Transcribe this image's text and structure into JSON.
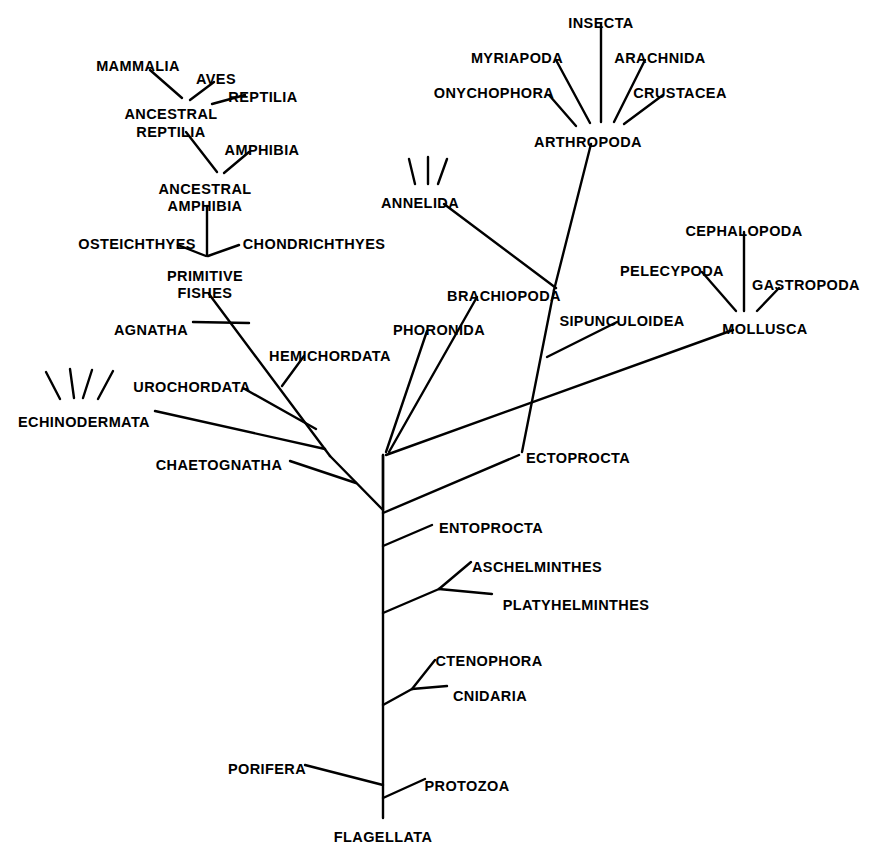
{
  "diagram": {
    "type": "phylogenetic-tree",
    "title": "",
    "background_color": "#ffffff",
    "line_color": "#000000",
    "text_color": "#000000",
    "root_taxon": "FLAGELLATA"
  },
  "labels": [
    {
      "id": "mammalia",
      "text": "MAMMALIA",
      "x": 138,
      "y": 58,
      "align": "center"
    },
    {
      "id": "aves",
      "text": "AVES",
      "x": 216,
      "y": 71,
      "align": "center"
    },
    {
      "id": "reptilia",
      "text": "REPTILIA",
      "x": 263,
      "y": 89,
      "align": "center"
    },
    {
      "id": "ancestral-reptilia-1",
      "text": "ANCESTRAL",
      "x": 171,
      "y": 106,
      "align": "center"
    },
    {
      "id": "ancestral-reptilia-2",
      "text": "REPTILIA",
      "x": 171,
      "y": 124,
      "align": "center"
    },
    {
      "id": "amphibia",
      "text": "AMPHIBIA",
      "x": 262,
      "y": 142,
      "align": "center"
    },
    {
      "id": "ancestral-amphibia-1",
      "text": "ANCESTRAL",
      "x": 205,
      "y": 181,
      "align": "center"
    },
    {
      "id": "ancestral-amphibia-2",
      "text": "AMPHIBIA",
      "x": 205,
      "y": 198,
      "align": "center"
    },
    {
      "id": "osteichthyes",
      "text": "OSTEICHTHYES",
      "x": 137,
      "y": 236,
      "align": "center"
    },
    {
      "id": "chondrichthyes",
      "text": "CHONDRICHTHYES",
      "x": 314,
      "y": 236,
      "align": "center"
    },
    {
      "id": "primitive-fishes-1",
      "text": "PRIMITIVE",
      "x": 205,
      "y": 268,
      "align": "center"
    },
    {
      "id": "primitive-fishes-2",
      "text": "FISHES",
      "x": 205,
      "y": 285,
      "align": "center"
    },
    {
      "id": "agnatha",
      "text": "AGNATHA",
      "x": 151,
      "y": 322,
      "align": "center"
    },
    {
      "id": "hemichordata",
      "text": "HEMICHORDATA",
      "x": 330,
      "y": 348,
      "align": "center"
    },
    {
      "id": "urochordata",
      "text": "UROCHORDATA",
      "x": 192,
      "y": 379,
      "align": "center"
    },
    {
      "id": "echinodermata",
      "text": "ECHINODERMATA",
      "x": 84,
      "y": 414,
      "align": "center"
    },
    {
      "id": "chaetognatha",
      "text": "CHAETOGNATHA",
      "x": 219,
      "y": 457,
      "align": "center"
    },
    {
      "id": "insecta",
      "text": "INSECTA",
      "x": 601,
      "y": 15,
      "align": "center"
    },
    {
      "id": "myriapoda",
      "text": "MYRIAPODA",
      "x": 517,
      "y": 50,
      "align": "center"
    },
    {
      "id": "arachnida",
      "text": "ARACHNIDA",
      "x": 660,
      "y": 50,
      "align": "center"
    },
    {
      "id": "onychophora",
      "text": "ONYCHOPHORA",
      "x": 494,
      "y": 85,
      "align": "center"
    },
    {
      "id": "crustacea",
      "text": "CRUSTACEA",
      "x": 680,
      "y": 85,
      "align": "center"
    },
    {
      "id": "arthropoda",
      "text": "ARTHROPODA",
      "x": 588,
      "y": 134,
      "align": "center"
    },
    {
      "id": "annelida",
      "text": "ANNELIDA",
      "x": 420,
      "y": 195,
      "align": "center"
    },
    {
      "id": "brachiopoda",
      "text": "BRACHIOPODA",
      "x": 504,
      "y": 288,
      "align": "center"
    },
    {
      "id": "phoronida",
      "text": "PHORONIDA",
      "x": 439,
      "y": 322,
      "align": "center"
    },
    {
      "id": "sipunculoidea",
      "text": "SIPUNCULOIDEA",
      "x": 622,
      "y": 313,
      "align": "center"
    },
    {
      "id": "cephalopoda",
      "text": "CEPHALOPODA",
      "x": 744,
      "y": 223,
      "align": "center"
    },
    {
      "id": "pelecypoda",
      "text": "PELECYPODA",
      "x": 672,
      "y": 263,
      "align": "center"
    },
    {
      "id": "gastropoda",
      "text": "GASTROPODA",
      "x": 806,
      "y": 277,
      "align": "center"
    },
    {
      "id": "mollusca",
      "text": "MOLLUSCA",
      "x": 765,
      "y": 321,
      "align": "center"
    },
    {
      "id": "ectoprocta",
      "text": "ECTOPROCTA",
      "x": 578,
      "y": 450,
      "align": "center"
    },
    {
      "id": "entoprocta",
      "text": "ENTOPROCTA",
      "x": 491,
      "y": 520,
      "align": "center"
    },
    {
      "id": "aschelminthes",
      "text": "ASCHELMINTHES",
      "x": 537,
      "y": 559,
      "align": "center"
    },
    {
      "id": "platyhelminthes",
      "text": "PLATYHELMINTHES",
      "x": 576,
      "y": 597,
      "align": "center"
    },
    {
      "id": "ctenophora",
      "text": "CTENOPHORA",
      "x": 489,
      "y": 653,
      "align": "center"
    },
    {
      "id": "cnidaria",
      "text": "CNIDARIA",
      "x": 490,
      "y": 688,
      "align": "center"
    },
    {
      "id": "porifera",
      "text": "PORIFERA",
      "x": 267,
      "y": 761,
      "align": "center"
    },
    {
      "id": "protozoa",
      "text": "PROTOZOA",
      "x": 467,
      "y": 778,
      "align": "center"
    },
    {
      "id": "flagellata",
      "text": "FLAGELLATA",
      "x": 383,
      "y": 829,
      "align": "center"
    }
  ],
  "branches": [
    {
      "id": "trunk-main",
      "from": [
        383,
        455
      ],
      "to": [
        383,
        818
      ]
    },
    {
      "id": "fan-stem",
      "from": [
        383,
        455
      ],
      "to": [
        383,
        510
      ]
    },
    {
      "id": "mammalia-branch",
      "from": [
        150,
        70
      ],
      "to": [
        182,
        98
      ]
    },
    {
      "id": "aves-branch",
      "from": [
        214,
        82
      ],
      "to": [
        190,
        100
      ]
    },
    {
      "id": "reptilia-branch",
      "from": [
        245,
        95
      ],
      "to": [
        212,
        104
      ]
    },
    {
      "id": "ancestral-reptilia-branch",
      "from": [
        186,
        132
      ],
      "to": [
        217,
        172
      ]
    },
    {
      "id": "amphibia-branch",
      "from": [
        249,
        152
      ],
      "to": [
        224,
        173
      ]
    },
    {
      "id": "ancestral-amphibia-trunk",
      "from": [
        207,
        206
      ],
      "to": [
        207,
        255
      ]
    },
    {
      "id": "osteichthyes-branch",
      "from": [
        178,
        245
      ],
      "to": [
        206,
        256
      ]
    },
    {
      "id": "chondrichthyes-branch",
      "from": [
        239,
        245
      ],
      "to": [
        208,
        256
      ]
    },
    {
      "id": "primitive-fishes-stem",
      "from": [
        209,
        294
      ],
      "to": [
        330,
        456
      ]
    },
    {
      "id": "agnatha-branch",
      "from": [
        193,
        322
      ],
      "to": [
        249,
        323
      ]
    },
    {
      "id": "hemichordata-branch",
      "from": [
        304,
        356
      ],
      "to": [
        282,
        386
      ]
    },
    {
      "id": "urochordata-branch",
      "from": [
        243,
        388
      ],
      "to": [
        316,
        429
      ]
    },
    {
      "id": "echinodermata-branch",
      "from": [
        155,
        411
      ],
      "to": [
        325,
        449
      ]
    },
    {
      "id": "chaetognatha-branch",
      "from": [
        290,
        461
      ],
      "to": [
        356,
        483
      ]
    },
    {
      "id": "chordate-stem",
      "from": [
        330,
        456
      ],
      "to": [
        383,
        510
      ]
    },
    {
      "id": "insecta-branch",
      "from": [
        601,
        24
      ],
      "to": [
        601,
        122
      ]
    },
    {
      "id": "myriapoda-branch",
      "from": [
        556,
        60
      ],
      "to": [
        590,
        123
      ]
    },
    {
      "id": "arachnida-branch",
      "from": [
        645,
        60
      ],
      "to": [
        614,
        122
      ]
    },
    {
      "id": "onychophora-branch",
      "from": [
        549,
        95
      ],
      "to": [
        576,
        126
      ]
    },
    {
      "id": "crustacea-branch",
      "from": [
        663,
        95
      ],
      "to": [
        624,
        124
      ]
    },
    {
      "id": "arthropoda-stem",
      "from": [
        591,
        144
      ],
      "to": [
        554,
        290
      ]
    },
    {
      "id": "arthropoda-lower",
      "from": [
        554,
        290
      ],
      "to": [
        522,
        452
      ]
    },
    {
      "id": "annelida-branch",
      "from": [
        444,
        204
      ],
      "to": [
        556,
        288
      ]
    },
    {
      "id": "brachiopoda-branch",
      "from": [
        477,
        297
      ],
      "to": [
        389,
        452
      ]
    },
    {
      "id": "phoronida-branch",
      "from": [
        427,
        331
      ],
      "to": [
        386,
        452
      ]
    },
    {
      "id": "sipunculoidea-branch",
      "from": [
        617,
        322
      ],
      "to": [
        547,
        357
      ]
    },
    {
      "id": "mollusca-stem",
      "from": [
        386,
        455
      ],
      "to": [
        733,
        330
      ]
    },
    {
      "id": "cephalopoda-branch",
      "from": [
        744,
        232
      ],
      "to": [
        744,
        311
      ]
    },
    {
      "id": "pelecypoda-branch",
      "from": [
        702,
        272
      ],
      "to": [
        736,
        311
      ]
    },
    {
      "id": "gastropoda-branch",
      "from": [
        779,
        288
      ],
      "to": [
        757,
        311
      ]
    },
    {
      "id": "ectoprocta-branch",
      "from": [
        519,
        455
      ],
      "to": [
        383,
        513
      ]
    },
    {
      "id": "entoprocta-branch",
      "from": [
        432,
        525
      ],
      "to": [
        383,
        546
      ]
    },
    {
      "id": "helminth-stem",
      "from": [
        383,
        613
      ],
      "to": [
        439,
        589
      ]
    },
    {
      "id": "aschelminthes-branch",
      "from": [
        439,
        589
      ],
      "to": [
        471,
        562
      ]
    },
    {
      "id": "platyhelminthes-branch",
      "from": [
        439,
        589
      ],
      "to": [
        492,
        594
      ]
    },
    {
      "id": "cnidaria-stem",
      "from": [
        383,
        705
      ],
      "to": [
        412,
        689
      ]
    },
    {
      "id": "ctenophora-branch",
      "from": [
        412,
        689
      ],
      "to": [
        435,
        660
      ]
    },
    {
      "id": "cnidaria-branch",
      "from": [
        412,
        689
      ],
      "to": [
        447,
        686
      ]
    },
    {
      "id": "porifera-branch",
      "from": [
        305,
        765
      ],
      "to": [
        383,
        785
      ]
    },
    {
      "id": "protozoa-branch",
      "from": [
        425,
        779
      ],
      "to": [
        383,
        798
      ]
    }
  ],
  "tick_marks": [
    {
      "group": "echinodermata-ticks",
      "lines": [
        [
          46,
          372,
          60,
          399
        ],
        [
          70,
          369,
          74,
          398
        ],
        [
          92,
          370,
          83,
          398
        ],
        [
          113,
          371,
          98,
          399
        ]
      ]
    },
    {
      "group": "annelida-ticks",
      "lines": [
        [
          409,
          159,
          415,
          184
        ],
        [
          428,
          157,
          428,
          184
        ],
        [
          447,
          159,
          438,
          184
        ]
      ]
    }
  ]
}
